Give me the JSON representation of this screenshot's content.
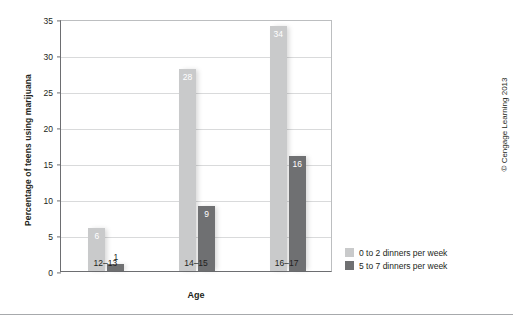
{
  "chart_data": {
    "type": "bar",
    "title": "",
    "xlabel": "Age",
    "ylabel": "Percentage of teens using marijuana",
    "categories": [
      "12–13",
      "14–15",
      "16–17"
    ],
    "series": [
      {
        "name": "0 to 2 dinners per week",
        "values": [
          6,
          28,
          34
        ],
        "color": "#c9cacb"
      },
      {
        "name": "5 to 7 dinners per week",
        "values": [
          1,
          9,
          16
        ],
        "color": "#6f7072"
      }
    ],
    "ylim": [
      0,
      35
    ],
    "yticks": [
      0,
      5,
      10,
      15,
      20,
      25,
      30,
      35
    ],
    "ytick_labels": [
      "0",
      "5",
      "10",
      "15",
      "20",
      "25",
      "30",
      "35"
    ],
    "grid": true,
    "legend_position": "right-bottom",
    "value_labels_shown": true
  },
  "credit": "© Cengage Learning 2013",
  "colors": {
    "light_bar": "#c9cacb",
    "dark_bar": "#6f7072",
    "grid": "#d9dadb",
    "axis": "#6d6e71",
    "text": "#231f20"
  }
}
